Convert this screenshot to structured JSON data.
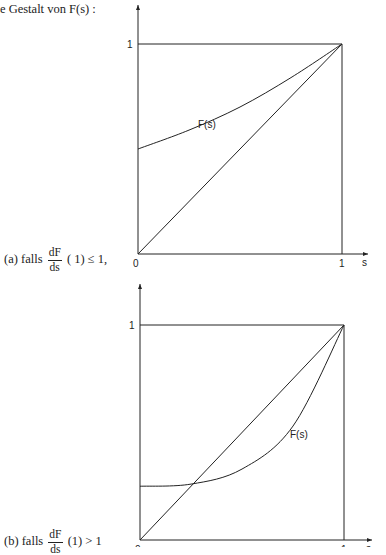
{
  "heading": "e Gestalt von F(s) :",
  "captions": {
    "a": {
      "prefix": "(a) falls",
      "num": "dF",
      "den": "ds",
      "suffix": "( 1) ≤ 1,"
    },
    "b": {
      "prefix": "(b) falls",
      "num": "dF",
      "den": "ds",
      "suffix": "(1) > 1"
    }
  },
  "chart_data": [
    {
      "type": "line",
      "id": "a",
      "title": "",
      "xlabel": "s",
      "ylabel": "",
      "xlim": [
        0,
        1
      ],
      "ylim": [
        0,
        1
      ],
      "x_ticks": [
        "0",
        "1"
      ],
      "y_ticks": [
        "1"
      ],
      "grid": false,
      "series": [
        {
          "name": "F(s)",
          "label": "F(s)",
          "x": [
            0,
            0.25,
            0.5,
            0.75,
            1
          ],
          "y": [
            0.5,
            0.59,
            0.7,
            0.84,
            1.0
          ]
        },
        {
          "name": "diagonal",
          "label": "",
          "x": [
            0,
            1
          ],
          "y": [
            0,
            1
          ]
        }
      ]
    },
    {
      "type": "line",
      "id": "b",
      "title": "",
      "xlabel": "s",
      "ylabel": "",
      "xlim": [
        0,
        1
      ],
      "ylim": [
        0,
        1
      ],
      "x_ticks": [
        "0",
        "1"
      ],
      "y_ticks": [
        "1"
      ],
      "grid": false,
      "series": [
        {
          "name": "F(s)",
          "label": "F(s)",
          "x": [
            0,
            0.25,
            0.5,
            0.75,
            1
          ],
          "y": [
            0.25,
            0.26,
            0.33,
            0.53,
            1.0
          ]
        },
        {
          "name": "diagonal",
          "label": "",
          "x": [
            0,
            1
          ],
          "y": [
            0,
            1
          ]
        }
      ]
    }
  ]
}
